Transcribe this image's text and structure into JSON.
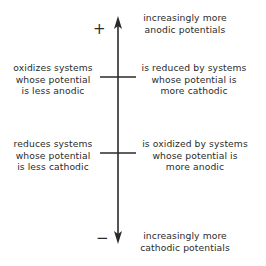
{
  "diagram": {
    "axis": {
      "positive_sign": "+",
      "negative_sign": "−",
      "line_color": "#2a2a2a"
    },
    "top_label": "increasingly more\nanodic potentials",
    "bottom_label": "increasingly more\ncathodic potentials",
    "upper_tick": {
      "left_label": "oxidizes systems\nwhose potential\nis less anodic",
      "right_label": "is reduced by systems\nwhose potential is\nmore cathodic"
    },
    "lower_tick": {
      "left_label": "reduces systems\nwhose potential\nis less cathodic",
      "right_label": "is oxidized by systems\nwhose potential is\nmore anodic"
    }
  }
}
